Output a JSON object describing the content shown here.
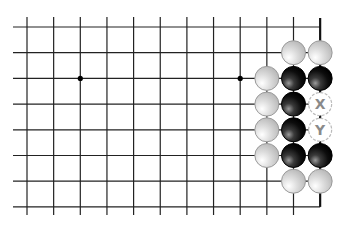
{
  "diagram": {
    "type": "go-board-fragment",
    "columns": 12,
    "rows": 8,
    "right_edge": true,
    "star_points": [
      {
        "col": 2,
        "row": 2
      },
      {
        "col": 8,
        "row": 2
      }
    ],
    "stones": [
      {
        "color": "white",
        "col": 10,
        "row": 1
      },
      {
        "color": "white",
        "col": 11,
        "row": 1
      },
      {
        "color": "white",
        "col": 9,
        "row": 2
      },
      {
        "color": "black",
        "col": 10,
        "row": 2
      },
      {
        "color": "black",
        "col": 11,
        "row": 2
      },
      {
        "color": "white",
        "col": 9,
        "row": 3
      },
      {
        "color": "black",
        "col": 10,
        "row": 3
      },
      {
        "color": "white",
        "col": 9,
        "row": 4
      },
      {
        "color": "black",
        "col": 10,
        "row": 4
      },
      {
        "color": "white",
        "col": 9,
        "row": 5
      },
      {
        "color": "black",
        "col": 10,
        "row": 5
      },
      {
        "color": "black",
        "col": 11,
        "row": 5
      },
      {
        "color": "white",
        "col": 10,
        "row": 6
      },
      {
        "color": "white",
        "col": 11,
        "row": 6
      }
    ],
    "markers": [
      {
        "label": "X",
        "col": 11,
        "row": 3
      },
      {
        "label": "Y",
        "col": 11,
        "row": 4
      }
    ],
    "colors": {
      "line": "#222222",
      "edge": "#111111",
      "black_stone": "#111111",
      "white_stone": "#d4d4d4",
      "marker_text": "#8a8a8a",
      "marker_border": "#bbbbbb"
    }
  }
}
